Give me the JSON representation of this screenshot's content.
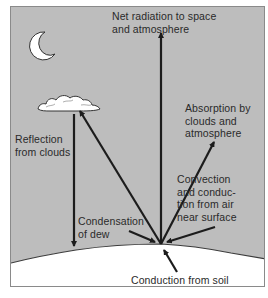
{
  "diagram": {
    "colors": {
      "sky": "#bdbdbd",
      "ground": "#ffffff",
      "arrow": "#1c1c1c",
      "text": "#2a2a2a",
      "frame": "#8a8a8a"
    },
    "icons": {
      "moon": "crescent-moon-icon",
      "cloud": "cloud-icon"
    },
    "labels": {
      "net_radiation": "Net radiation to space\nand atmosphere",
      "absorption": "Absorption by\nclouds and\natmosphere",
      "reflection": "Reflection\nfrom clouds",
      "convection": "Convection\nand conduc-\ntion from air\nnear surface",
      "condensation": "Condensation\nof dew",
      "conduction_soil": "Conduction from soil"
    },
    "flows": [
      {
        "name": "Net radiation to space and atmosphere",
        "direction": "up",
        "from": "surface",
        "to": "space"
      },
      {
        "name": "Absorption by clouds and atmosphere",
        "direction": "up-right",
        "from": "surface",
        "to": "atmosphere"
      },
      {
        "name": "Emission to clouds",
        "direction": "up-left",
        "from": "surface",
        "to": "cloud"
      },
      {
        "name": "Reflection from clouds",
        "direction": "down",
        "from": "cloud",
        "to": "surface"
      },
      {
        "name": "Convection and conduction from air near surface",
        "direction": "down-left",
        "from": "air",
        "to": "surface"
      },
      {
        "name": "Condensation of dew",
        "direction": "down-right",
        "from": "air",
        "to": "surface"
      },
      {
        "name": "Conduction from soil",
        "direction": "up",
        "from": "soil",
        "to": "surface"
      }
    ]
  }
}
